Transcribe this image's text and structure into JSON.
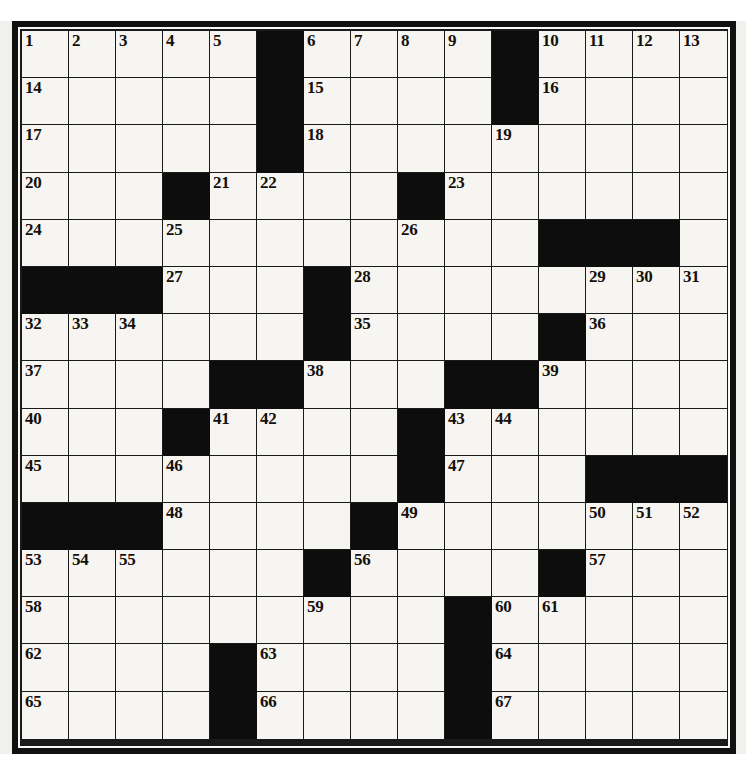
{
  "puzzle": {
    "type": "crossword-grid",
    "rows": 15,
    "columns": 15,
    "cell_size_px": 47,
    "colors": {
      "paper": "#f2f0ec",
      "cell_fill": "#f7f5f1",
      "block_fill": "#0d0d0d",
      "grid_line": "#1a1a1a",
      "number_text": "#14100c"
    },
    "legend": {
      "block_symbol": "#",
      "open_symbol": "."
    },
    "layout": [
      ".....#....#....",
      ".....#....#....",
      ".....#.........",
      "...#....#......",
      "...........###",
      "###...#........",
      "......#....#...",
      "....##...##....",
      "...#....#......",
      "........#...###",
      "###....#.......",
      "......#....#...",
      ".........#.....",
      "....#....#.....",
      "....#....#....."
    ],
    "numbers": [
      {
        "n": 1,
        "row": 0,
        "col": 0
      },
      {
        "n": 2,
        "row": 0,
        "col": 1
      },
      {
        "n": 3,
        "row": 0,
        "col": 2
      },
      {
        "n": 4,
        "row": 0,
        "col": 3
      },
      {
        "n": 5,
        "row": 0,
        "col": 4
      },
      {
        "n": 6,
        "row": 0,
        "col": 6
      },
      {
        "n": 7,
        "row": 0,
        "col": 7
      },
      {
        "n": 8,
        "row": 0,
        "col": 8
      },
      {
        "n": 9,
        "row": 0,
        "col": 9
      },
      {
        "n": 10,
        "row": 0,
        "col": 11
      },
      {
        "n": 11,
        "row": 0,
        "col": 12
      },
      {
        "n": 12,
        "row": 0,
        "col": 13
      },
      {
        "n": 13,
        "row": 0,
        "col": 14
      },
      {
        "n": 14,
        "row": 1,
        "col": 0
      },
      {
        "n": 15,
        "row": 1,
        "col": 6
      },
      {
        "n": 16,
        "row": 1,
        "col": 11
      },
      {
        "n": 17,
        "row": 2,
        "col": 0
      },
      {
        "n": 18,
        "row": 2,
        "col": 6
      },
      {
        "n": 19,
        "row": 2,
        "col": 10
      },
      {
        "n": 20,
        "row": 3,
        "col": 0
      },
      {
        "n": 21,
        "row": 3,
        "col": 4
      },
      {
        "n": 22,
        "row": 3,
        "col": 5
      },
      {
        "n": 23,
        "row": 3,
        "col": 9
      },
      {
        "n": 24,
        "row": 4,
        "col": 0
      },
      {
        "n": 25,
        "row": 4,
        "col": 3
      },
      {
        "n": 26,
        "row": 4,
        "col": 8
      },
      {
        "n": 27,
        "row": 5,
        "col": 3
      },
      {
        "n": 28,
        "row": 5,
        "col": 7
      },
      {
        "n": 29,
        "row": 5,
        "col": 12
      },
      {
        "n": 30,
        "row": 5,
        "col": 13
      },
      {
        "n": 31,
        "row": 5,
        "col": 14
      },
      {
        "n": 32,
        "row": 6,
        "col": 0
      },
      {
        "n": 33,
        "row": 6,
        "col": 1
      },
      {
        "n": 34,
        "row": 6,
        "col": 2
      },
      {
        "n": 35,
        "row": 6,
        "col": 7
      },
      {
        "n": 36,
        "row": 6,
        "col": 12
      },
      {
        "n": 37,
        "row": 7,
        "col": 0
      },
      {
        "n": 38,
        "row": 7,
        "col": 6
      },
      {
        "n": 39,
        "row": 7,
        "col": 11
      },
      {
        "n": 40,
        "row": 8,
        "col": 0
      },
      {
        "n": 41,
        "row": 8,
        "col": 4
      },
      {
        "n": 42,
        "row": 8,
        "col": 5
      },
      {
        "n": 43,
        "row": 8,
        "col": 9
      },
      {
        "n": 44,
        "row": 8,
        "col": 10
      },
      {
        "n": 45,
        "row": 9,
        "col": 0
      },
      {
        "n": 46,
        "row": 9,
        "col": 3
      },
      {
        "n": 47,
        "row": 9,
        "col": 9
      },
      {
        "n": 48,
        "row": 10,
        "col": 3
      },
      {
        "n": 49,
        "row": 10,
        "col": 8
      },
      {
        "n": 50,
        "row": 10,
        "col": 12
      },
      {
        "n": 51,
        "row": 10,
        "col": 13
      },
      {
        "n": 52,
        "row": 10,
        "col": 14
      },
      {
        "n": 53,
        "row": 11,
        "col": 0
      },
      {
        "n": 54,
        "row": 11,
        "col": 1
      },
      {
        "n": 55,
        "row": 11,
        "col": 2
      },
      {
        "n": 56,
        "row": 11,
        "col": 7
      },
      {
        "n": 57,
        "row": 11,
        "col": 12
      },
      {
        "n": 58,
        "row": 12,
        "col": 0
      },
      {
        "n": 59,
        "row": 12,
        "col": 6
      },
      {
        "n": 60,
        "row": 12,
        "col": 10
      },
      {
        "n": 61,
        "row": 12,
        "col": 11
      },
      {
        "n": 62,
        "row": 13,
        "col": 0
      },
      {
        "n": 63,
        "row": 13,
        "col": 5
      },
      {
        "n": 64,
        "row": 13,
        "col": 10
      },
      {
        "n": 65,
        "row": 14,
        "col": 0
      },
      {
        "n": 66,
        "row": 14,
        "col": 5
      },
      {
        "n": 67,
        "row": 14,
        "col": 10
      }
    ]
  }
}
